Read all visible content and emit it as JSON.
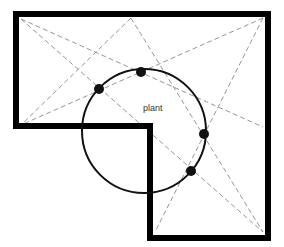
{
  "diagram": {
    "label": "plant",
    "colors": {
      "wall": "#000000",
      "dashed": "#8a8a8a",
      "circle": "#111111",
      "dot": "#111111",
      "background": "#ffffff"
    },
    "wall_path": [
      [
        16,
        14
      ],
      [
        268,
        14
      ],
      [
        268,
        238
      ],
      [
        150,
        238
      ],
      [
        150,
        126
      ],
      [
        16,
        126
      ]
    ],
    "vertices": {
      "top_left": [
        21,
        19
      ],
      "top_mid": [
        131,
        18
      ],
      "top_right": [
        263,
        18
      ],
      "right_mid": [
        263,
        127
      ],
      "bottom_right": [
        263,
        232
      ],
      "bottom_inner": [
        155,
        232
      ],
      "left_bottom": [
        21,
        125
      ]
    },
    "dashed_lines": [
      [
        [
          21,
          19
        ],
        [
          263,
          127
        ]
      ],
      [
        [
          21,
          19
        ],
        [
          263,
          232
        ]
      ],
      [
        [
          131,
          18
        ],
        [
          21,
          125
        ]
      ],
      [
        [
          131,
          18
        ],
        [
          263,
          232
        ]
      ],
      [
        [
          263,
          18
        ],
        [
          21,
          125
        ]
      ],
      [
        [
          263,
          18
        ],
        [
          155,
          232
        ]
      ]
    ],
    "circle": {
      "cx": 144,
      "cy": 131,
      "r": 62
    },
    "dots": [
      [
        99,
        89
      ],
      [
        141,
        72
      ],
      [
        204,
        134
      ],
      [
        191,
        171
      ]
    ]
  }
}
